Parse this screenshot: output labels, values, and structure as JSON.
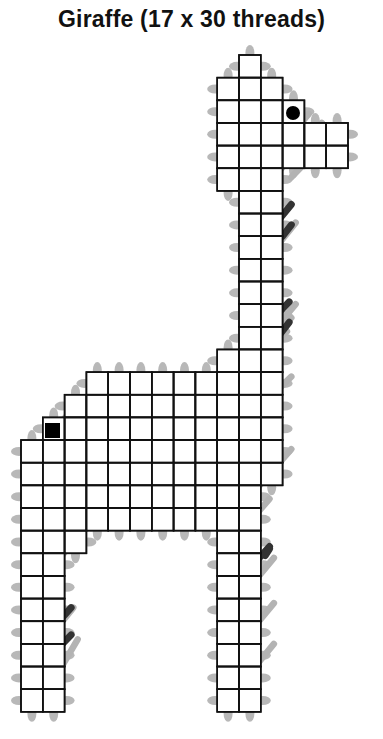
{
  "title": "Giraffe (17 x 30 threads)",
  "colors": {
    "grid": "#111111",
    "cell_fill": "#ffffff",
    "light_stitch": "#b3b3b3",
    "dark_stitch": "#333333",
    "edge_dot": "#b8b8b8",
    "marker": "#000000"
  },
  "grid": {
    "x0": 21,
    "y0": 55,
    "cell_w": 21.8,
    "cell_h": 22.65,
    "columns": 16,
    "rows": 29,
    "row_spans": [
      [
        [
          10,
          11
        ]
      ],
      [
        [
          9,
          12
        ]
      ],
      [
        [
          9,
          13
        ]
      ],
      [
        [
          9,
          15
        ]
      ],
      [
        [
          9,
          15
        ]
      ],
      [
        [
          9,
          12
        ]
      ],
      [
        [
          10,
          12
        ]
      ],
      [
        [
          10,
          12
        ]
      ],
      [
        [
          10,
          12
        ]
      ],
      [
        [
          10,
          12
        ]
      ],
      [
        [
          10,
          12
        ]
      ],
      [
        [
          10,
          12
        ]
      ],
      [
        [
          10,
          12
        ]
      ],
      [
        [
          9,
          12
        ]
      ],
      [
        [
          3,
          12
        ]
      ],
      [
        [
          2,
          12
        ]
      ],
      [
        [
          1,
          12
        ]
      ],
      [
        [
          0,
          12
        ]
      ],
      [
        [
          0,
          12
        ]
      ],
      [
        [
          0,
          11
        ]
      ],
      [
        [
          0,
          11
        ]
      ],
      [
        [
          0,
          3
        ],
        [
          9,
          11
        ]
      ],
      [
        [
          0,
          2
        ],
        [
          9,
          11
        ]
      ],
      [
        [
          0,
          2
        ],
        [
          9,
          11
        ]
      ],
      [
        [
          0,
          2
        ],
        [
          9,
          11
        ]
      ],
      [
        [
          0,
          2
        ],
        [
          9,
          11
        ]
      ],
      [
        [
          0,
          2
        ],
        [
          9,
          11
        ]
      ],
      [
        [
          0,
          2
        ],
        [
          9,
          11
        ]
      ],
      [
        [
          0,
          2
        ],
        [
          9,
          11
        ]
      ]
    ]
  },
  "light_stitches": [
    [
      10.4,
      5.8,
      13.2,
      2.6
    ],
    [
      11.4,
      5.6,
      13.8,
      3.0
    ],
    [
      12.4,
      5.4,
      14.6,
      3.2
    ],
    [
      10.6,
      4.6,
      12.2,
      2.8
    ],
    [
      10.6,
      9.8,
      12.6,
      7.4
    ],
    [
      11.2,
      12.6,
      12.6,
      11.0
    ],
    [
      9.6,
      14.4,
      12.4,
      11.6
    ],
    [
      8.6,
      14.8,
      12.2,
      12.2
    ],
    [
      7.6,
      15.8,
      11.4,
      12.4
    ],
    [
      0.4,
      17.8,
      2.4,
      15.6
    ],
    [
      1.4,
      17.6,
      4.2,
      14.6
    ],
    [
      3.4,
      18.4,
      6.6,
      15.2
    ],
    [
      5.6,
      18.0,
      8.2,
      15.4
    ],
    [
      7.6,
      17.8,
      10.4,
      15.0
    ],
    [
      9.6,
      16.8,
      12.4,
      14.2
    ],
    [
      1.4,
      19.6,
      3.4,
      17.4
    ],
    [
      3.6,
      19.8,
      5.4,
      18.0
    ],
    [
      5.4,
      20.6,
      8.4,
      17.6
    ],
    [
      0.5,
      20.8,
      2.6,
      18.6
    ],
    [
      9.4,
      18.8,
      11.6,
      16.6
    ],
    [
      10.4,
      19.6,
      12.4,
      17.4
    ],
    [
      1.4,
      21.8,
      2.6,
      20.4
    ],
    [
      1.6,
      22.4,
      3.4,
      20.4
    ],
    [
      4.4,
      20.8,
      6.6,
      18.6
    ],
    [
      7.4,
      20.8,
      9.6,
      18.6
    ],
    [
      9.4,
      21.8,
      11.4,
      19.6
    ],
    [
      1.4,
      25.6,
      2.4,
      24.4
    ],
    [
      1.5,
      27.6,
      2.6,
      25.8
    ],
    [
      10.4,
      23.6,
      11.6,
      22.2
    ],
    [
      10.4,
      25.6,
      11.6,
      24.2
    ],
    [
      10.4,
      27.4,
      11.6,
      26.0
    ]
  ],
  "dark_stitches": [
    [
      9.8,
      3.0,
      11.4,
      1.5
    ],
    [
      9.6,
      4.2,
      10.2,
      3.6
    ],
    [
      9.6,
      2.4,
      10.0,
      2.0
    ],
    [
      11.2,
      8.0,
      12.4,
      6.6
    ],
    [
      11.2,
      6.8,
      11.6,
      6.3
    ],
    [
      12.0,
      8.0,
      12.4,
      7.5
    ],
    [
      11.9,
      11.3,
      12.3,
      10.9
    ],
    [
      11.9,
      12.3,
      12.3,
      11.8
    ],
    [
      0.9,
      25.9,
      2.3,
      24.4
    ],
    [
      0.9,
      24.6,
      1.3,
      24.2
    ],
    [
      1.9,
      26.0,
      2.3,
      25.6
    ],
    [
      2.4,
      19.6,
      3.6,
      18.2
    ],
    [
      2.4,
      18.4,
      2.8,
      17.9
    ],
    [
      3.4,
      19.8,
      3.8,
      19.2
    ],
    [
      4.3,
      15.6,
      4.8,
      15.1
    ],
    [
      5.2,
      16.4,
      6.3,
      15.2
    ],
    [
      5.2,
      15.5,
      5.6,
      15.1
    ],
    [
      6.2,
      16.5,
      6.6,
      16.0
    ],
    [
      7.3,
      18.6,
      8.4,
      17.3
    ],
    [
      7.3,
      17.5,
      7.7,
      17.0
    ],
    [
      8.2,
      18.6,
      8.6,
      18.1
    ],
    [
      10.2,
      17.6,
      11.4,
      16.2
    ],
    [
      10.2,
      18.6,
      11.4,
      17.3
    ],
    [
      10.2,
      16.4,
      10.6,
      16.0
    ],
    [
      11.2,
      18.8,
      11.6,
      18.4
    ],
    [
      10.0,
      22.0,
      10.4,
      21.6
    ],
    [
      10.0,
      23.2,
      11.4,
      21.7
    ],
    [
      11.2,
      22.1,
      11.4,
      21.8
    ]
  ],
  "markers": {
    "circle": {
      "cx": 293,
      "cy": 113,
      "r": 7
    },
    "square": {
      "x": 45,
      "y": 423,
      "size": 15
    }
  }
}
